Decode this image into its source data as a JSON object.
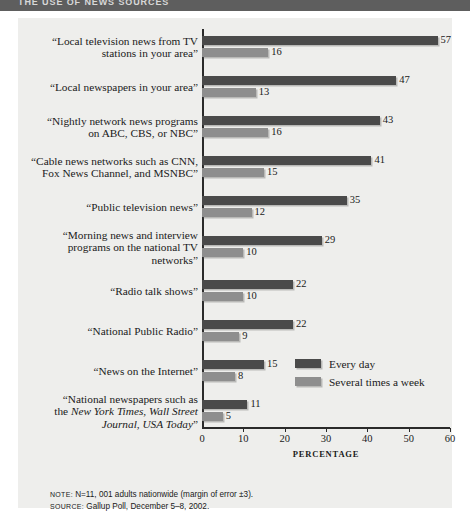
{
  "header": {
    "title": "THE USE OF NEWS SOURCES"
  },
  "footnotes": {
    "note_key": "NOTE:",
    "note_text": " N=11, 001 adults nationwide (margin of error ±3).",
    "source_key": "SOURCE:",
    "source_text": " Gallup Poll, December 5–8, 2002."
  },
  "colors": {
    "every_day": "#4a4a4a",
    "several_times": "#8e8e8e",
    "panel_background": "#eeeeec",
    "header_bar": "#5e5e5e",
    "axis": "#2a2a2a"
  },
  "chart_data": {
    "type": "bar",
    "orientation": "horizontal",
    "title": "THE USE OF NEWS SOURCES",
    "xlabel": "PERCENTAGE",
    "ylabel": "",
    "xlim": [
      0,
      60
    ],
    "xticks": [
      0,
      10,
      20,
      30,
      40,
      50,
      60
    ],
    "grid": false,
    "legend_position": "inside-right-lower",
    "categories": [
      "“Local television news from TV stations in your area”",
      "“Local newspapers in your area”",
      "“Nightly network news programs on ABC, CBS,  or NBC”",
      "“Cable news networks such as CNN, Fox News Channel, and MSNBC”",
      "“Public television news”",
      "“Morning news and interview programs on the national TV networks”",
      "“Radio talk shows”",
      "“National Public Radio”",
      "“News on the Internet”",
      "“National newspapers such as the New York Times, Wall Street Journal, USA Today”"
    ],
    "series": [
      {
        "name": "Every day",
        "values": [
          57,
          47,
          43,
          41,
          35,
          29,
          22,
          22,
          15,
          11
        ]
      },
      {
        "name": "Several times a week",
        "values": [
          16,
          13,
          16,
          15,
          12,
          10,
          10,
          9,
          8,
          5
        ]
      }
    ]
  },
  "category_labels": [
    {
      "line1": "“Local television news from TV",
      "line2": "stations in your area”"
    },
    {
      "line1": "“Local newspapers in your area”",
      "line2": ""
    },
    {
      "line1": "“Nightly network news programs",
      "line2": "on ABC, CBS,  or NBC”"
    },
    {
      "line1": "“Cable news networks such as CNN,",
      "line2": "Fox News Channel, and MSNBC”"
    },
    {
      "line1": "“Public television news”",
      "line2": ""
    },
    {
      "line1": "“Morning news and interview",
      "line2": "programs on the national TV",
      "line3": "networks”"
    },
    {
      "line1": "“Radio talk shows”",
      "line2": ""
    },
    {
      "line1": "“National Public Radio”",
      "line2": ""
    },
    {
      "line1": "“News on the Internet”",
      "line2": ""
    },
    {
      "line1": "“National newspapers such as",
      "line2_pre": "the ",
      "line2_italic": "New York Times, Wall Street",
      "line3_italic": "Journal, USA Today",
      "line3_post": "”"
    }
  ],
  "tick_labels": [
    "0",
    "10",
    "20",
    "30",
    "40",
    "50",
    "60"
  ]
}
